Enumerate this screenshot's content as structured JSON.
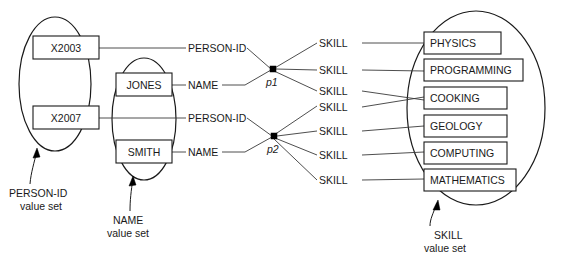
{
  "diagram": {
    "colors": {
      "stroke": "#1a1a1a",
      "line": "#3a3a3a",
      "background": "#ffffff"
    },
    "value_sets": [
      {
        "id": "person-id",
        "caption_line1": "PERSON-ID",
        "caption_line2": "value set",
        "values": [
          "X2003",
          "X2007"
        ]
      },
      {
        "id": "name",
        "caption_line1": "NAME",
        "caption_line2": "value set",
        "values": [
          "JONES",
          "SMITH"
        ]
      },
      {
        "id": "skill",
        "caption_line1": "SKILL",
        "caption_line2": "value set",
        "values": [
          "PHYSICS",
          "PROGRAMMING",
          "COOKING",
          "GEOLOGY",
          "COMPUTING",
          "MATHEMATICS"
        ]
      }
    ],
    "entities": [
      {
        "id": "p1",
        "label": "p1"
      },
      {
        "id": "p2",
        "label": "p2"
      }
    ],
    "edge_labels": {
      "person_id": "PERSON-ID",
      "name": "NAME",
      "skill": "SKILL"
    },
    "edges": [
      {
        "from": "X2003",
        "to": "p1",
        "label": "PERSON-ID"
      },
      {
        "from": "JONES",
        "to": "p1",
        "label": "NAME"
      },
      {
        "from": "X2007",
        "to": "p2",
        "label": "PERSON-ID"
      },
      {
        "from": "SMITH",
        "to": "p2",
        "label": "NAME"
      },
      {
        "from": "p1",
        "to": "PHYSICS",
        "label": "SKILL"
      },
      {
        "from": "p1",
        "to": "PROGRAMMING",
        "label": "SKILL"
      },
      {
        "from": "p1",
        "to": "COOKING",
        "label": "SKILL"
      },
      {
        "from": "p2",
        "to": "COOKING",
        "label": "SKILL"
      },
      {
        "from": "p2",
        "to": "GEOLOGY",
        "label": "SKILL"
      },
      {
        "from": "p2",
        "to": "COMPUTING",
        "label": "SKILL"
      },
      {
        "from": "p2",
        "to": "MATHEMATICS",
        "label": "SKILL"
      }
    ]
  }
}
